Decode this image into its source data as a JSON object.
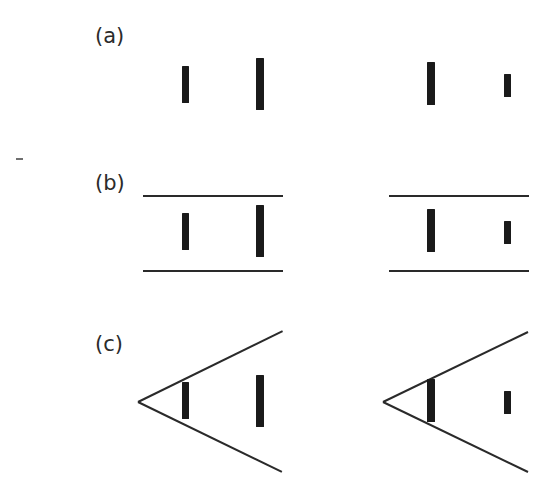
{
  "figure": {
    "background_color": "#ffffff",
    "ink_color": "#1a1a1a",
    "line_color": "#2a2a2a",
    "width": 551,
    "height": 491
  },
  "panels": [
    {
      "id": "a",
      "label": "(a)",
      "context": "none",
      "groups": [
        {
          "side": "left",
          "bars": [
            {
              "name": "inner-bar",
              "x": 182,
              "y": 66,
              "w": 7,
              "h": 37
            },
            {
              "name": "outer-bar",
              "x": 256,
              "y": 58,
              "w": 8,
              "h": 52
            }
          ]
        },
        {
          "side": "right",
          "bars": [
            {
              "name": "inner-bar",
              "x": 427,
              "y": 62,
              "w": 8,
              "h": 43
            },
            {
              "name": "outer-bar",
              "x": 504,
              "y": 74,
              "w": 7,
              "h": 23
            }
          ]
        }
      ]
    },
    {
      "id": "b",
      "label": "(b)",
      "context": "parallel-horizontal-lines",
      "groups": [
        {
          "side": "left",
          "lines": [
            {
              "name": "top-line",
              "x": 143,
              "y": 195,
              "length": 140
            },
            {
              "name": "bottom-line",
              "x": 143,
              "y": 270,
              "length": 140
            }
          ],
          "bars": [
            {
              "name": "inner-bar",
              "x": 182,
              "y": 213,
              "w": 7,
              "h": 37
            },
            {
              "name": "outer-bar",
              "x": 256,
              "y": 205,
              "w": 8,
              "h": 52
            }
          ]
        },
        {
          "side": "right",
          "lines": [
            {
              "name": "top-line",
              "x": 389,
              "y": 195,
              "length": 140
            },
            {
              "name": "bottom-line",
              "x": 389,
              "y": 270,
              "length": 140
            }
          ],
          "bars": [
            {
              "name": "inner-bar",
              "x": 427,
              "y": 209,
              "w": 8,
              "h": 43
            },
            {
              "name": "outer-bar",
              "x": 504,
              "y": 221,
              "w": 7,
              "h": 23
            }
          ]
        }
      ]
    },
    {
      "id": "c",
      "label": "(c)",
      "context": "converging-oblique-lines",
      "groups": [
        {
          "side": "left",
          "vertex": {
            "x": 138,
            "y": 402
          },
          "rays": [
            {
              "name": "upper-ray",
              "x2": 283,
              "y2": 331
            },
            {
              "name": "lower-ray",
              "x2": 282,
              "y2": 472
            }
          ],
          "bars": [
            {
              "name": "inner-bar",
              "x": 182,
              "y": 382,
              "w": 7,
              "h": 37
            },
            {
              "name": "outer-bar",
              "x": 256,
              "y": 375,
              "w": 8,
              "h": 52
            }
          ]
        },
        {
          "side": "right",
          "vertex": {
            "x": 383,
            "y": 402
          },
          "rays": [
            {
              "name": "upper-ray",
              "x2": 528,
              "y2": 332
            },
            {
              "name": "lower-ray",
              "x2": 528,
              "y2": 472
            }
          ],
          "bars": [
            {
              "name": "inner-bar",
              "x": 427,
              "y": 379,
              "w": 8,
              "h": 43
            },
            {
              "name": "outer-bar",
              "x": 504,
              "y": 391,
              "w": 7,
              "h": 23
            }
          ]
        }
      ]
    }
  ],
  "label_positions": {
    "a": {
      "x": 95,
      "y": 26
    },
    "b": {
      "x": 95,
      "y": 173
    },
    "c": {
      "x": 95,
      "y": 334
    }
  },
  "artifacts": [
    {
      "name": "scan-speck",
      "x": 16,
      "y": 158,
      "w": 7,
      "h": 2
    }
  ]
}
